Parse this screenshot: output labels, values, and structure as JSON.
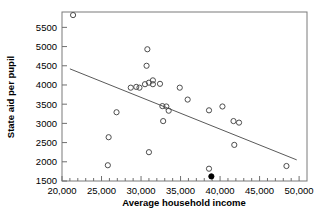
{
  "chart_data": {
    "type": "scatter",
    "title": "",
    "xlabel": "Average household income",
    "ylabel": "State aid per pupil",
    "xlim": [
      20000,
      51000
    ],
    "ylim": [
      1500,
      5900
    ],
    "grid": false,
    "legend": null,
    "x_ticks": [
      20000,
      25000,
      30000,
      35000,
      40000,
      45000,
      50000
    ],
    "x_tick_labels": [
      "20,000",
      "25,000",
      "30,000",
      "35,000",
      "40,000",
      "45,000",
      "50,000"
    ],
    "x_minor_tick_step": 1000,
    "y_ticks": [
      1500,
      2000,
      2500,
      3000,
      3500,
      4000,
      4500,
      5000,
      5500
    ],
    "y_tick_labels": [
      "1500",
      "2000",
      "2500",
      "3000",
      "3500",
      "4000",
      "4500",
      "5000",
      "5500"
    ],
    "series": [
      {
        "name": "districts-open",
        "marker": "open-circle",
        "color": "#4d4d4d",
        "points": [
          {
            "x": 21400,
            "y": 5820
          },
          {
            "x": 30800,
            "y": 4930
          },
          {
            "x": 30700,
            "y": 4500
          },
          {
            "x": 31500,
            "y": 4120
          },
          {
            "x": 31500,
            "y": 4020
          },
          {
            "x": 31000,
            "y": 4060
          },
          {
            "x": 30500,
            "y": 4020
          },
          {
            "x": 32400,
            "y": 4030
          },
          {
            "x": 28700,
            "y": 3930
          },
          {
            "x": 29400,
            "y": 3950
          },
          {
            "x": 29800,
            "y": 3930
          },
          {
            "x": 34900,
            "y": 3930
          },
          {
            "x": 35900,
            "y": 3620
          },
          {
            "x": 26900,
            "y": 3290
          },
          {
            "x": 32700,
            "y": 3450
          },
          {
            "x": 33200,
            "y": 3440
          },
          {
            "x": 33500,
            "y": 3330
          },
          {
            "x": 38600,
            "y": 3340
          },
          {
            "x": 40300,
            "y": 3440
          },
          {
            "x": 32800,
            "y": 3060
          },
          {
            "x": 41700,
            "y": 3060
          },
          {
            "x": 42400,
            "y": 3020
          },
          {
            "x": 25900,
            "y": 2640
          },
          {
            "x": 41800,
            "y": 2440
          },
          {
            "x": 31000,
            "y": 2250
          },
          {
            "x": 25800,
            "y": 1910
          },
          {
            "x": 48400,
            "y": 1890
          },
          {
            "x": 38600,
            "y": 1820
          }
        ]
      },
      {
        "name": "highlighted-district",
        "marker": "filled-circle",
        "color": "#000000",
        "points": [
          {
            "x": 38900,
            "y": 1620
          }
        ]
      }
    ],
    "trend_line": {
      "name": "least-squares-fit",
      "color": "#5a5a5a",
      "x_start": 21000,
      "y_start": 4420,
      "x_end": 49700,
      "y_end": 2050
    }
  }
}
